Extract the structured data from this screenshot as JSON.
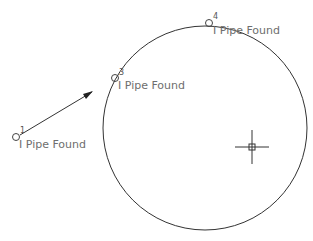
{
  "drawing": {
    "background": "#ffffff",
    "stroke_color": "#333333",
    "text_color": "#6e6e6e",
    "large_circle": {
      "cx": 205,
      "cy": 128,
      "r": 102
    },
    "crosshair": {
      "x": 252,
      "y": 147,
      "arm": 17,
      "box": 3
    },
    "arrow": {
      "x1": 20,
      "y1": 135,
      "x2": 92,
      "y2": 92
    },
    "points": [
      {
        "number": "1",
        "label": "I Pipe Found",
        "cx": 16,
        "cy": 137
      },
      {
        "number": "3",
        "label": "I Pipe Found",
        "cx": 115,
        "cy": 78
      },
      {
        "number": "4",
        "label": "I Pipe Found",
        "cx": 209,
        "cy": 23
      }
    ]
  }
}
